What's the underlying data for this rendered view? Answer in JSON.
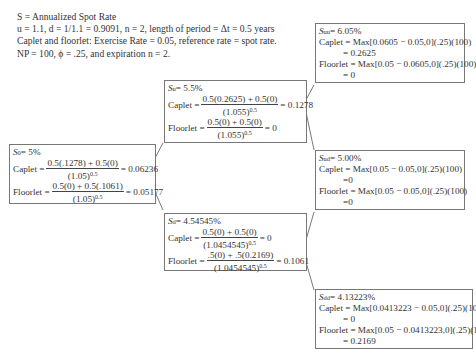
{
  "header": {
    "line1": "S = Annualized Spot Rate",
    "line2": "u = 1.1, d = 1/1.1 = 0.9091, n = 2, length of period = Δt = 0.5 years",
    "line3": "Caplet and floorlet: Exercise Rate = 0.05, reference rate = spot rate.",
    "line4": "NP = 100, ϕ = .25, and expiration n = 2."
  },
  "nodes": {
    "s0": {
      "label": "S",
      "sub": "0",
      "rate": " = 5%",
      "caplet_label": "Caplet = ",
      "caplet_num": "0.5(.1278) + 0.5(0)",
      "caplet_den": "(1.05)",
      "caplet_exp": "0.5",
      "caplet_result": " = 0.06236",
      "floorlet_label": "Floorlet = ",
      "floorlet_num": "0.5(0) + 0.5(.1061)",
      "floorlet_den": "(1.05)",
      "floorlet_exp": "0.5",
      "floorlet_result": " = 0.05177"
    },
    "su": {
      "label": "S",
      "sub": "u",
      "rate": " = 5.5%",
      "caplet_label": "Caplet = ",
      "caplet_num": "0.5(0.2625) + 0.5(0)",
      "caplet_den": "(1.055)",
      "caplet_exp": "0.5",
      "caplet_result": " = 0.1278",
      "floorlet_label": "Floorlet = ",
      "floorlet_num": "0.5(0) + 0.5(0)",
      "floorlet_den": "(1.055)",
      "floorlet_exp": "0.5",
      "floorlet_result": " = 0"
    },
    "sd": {
      "label": "S",
      "sub": "d",
      "rate": " = 4.54545%",
      "caplet_label": "Caplet = ",
      "caplet_num": "0.5(0) + 0.5(0)",
      "caplet_den": "(1.0454545)",
      "caplet_exp": "0.5",
      "caplet_result": " = 0",
      "floorlet_label": "Floorlet = ",
      "floorlet_num": ".5(0) + .5(0.2169)",
      "floorlet_den": "(1.0454545)",
      "floorlet_exp": "0.5",
      "floorlet_result": " = 0.1061"
    },
    "suu": {
      "label": "S",
      "sub": "uu",
      "rate": " = 6.05%",
      "caplet_line": "Caplet = Max[0.0605 − 0.05,0](.25)(100)",
      "caplet_result": "= 0.2625",
      "floorlet_line": "Floorlet = Max[0.05 − 0.0605,0](.25)(100)",
      "floorlet_result": "= 0"
    },
    "sud": {
      "label": "S",
      "sub": "ud",
      "rate": " = 5.00%",
      "caplet_line": "Caplet = Max[0.05 − 0.05,0](.25)(100)",
      "caplet_result": "=0",
      "floorlet_line": "Floorlet = Max[0.05 − 0.05,0](.25)(100)",
      "floorlet_result": "=0"
    },
    "sdd": {
      "label": "S",
      "sub": "dd",
      "rate": " = 4.13223%",
      "caplet_line": "Caplet = Max[0.0413223 − 0.05,0](.25)(100)",
      "caplet_result": "= 0",
      "floorlet_line": "Floorlet = Max[0.05 − 0.0413223,0](.25)(100)",
      "floorlet_result": "= 0.2169"
    }
  }
}
